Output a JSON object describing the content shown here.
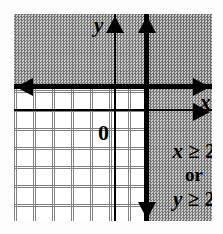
{
  "figure": {
    "type": "coordinate-plane-inequality-graph"
  },
  "axes": {
    "x_label": "x",
    "y_label": "y",
    "origin_label": "0",
    "x_axis_name": "x-axis",
    "y_axis_name": "y-axis",
    "grid_cell_size": 19,
    "grid_visible": true
  },
  "boundaries": [
    {
      "name": "horizontal-boundary",
      "equation": "y = 2",
      "style": "solid",
      "orientation": "horizontal",
      "arrows": [
        "left",
        "right"
      ]
    },
    {
      "name": "vertical-boundary",
      "equation": "x = 2",
      "style": "solid",
      "orientation": "vertical",
      "arrows": [
        "up",
        "down"
      ]
    }
  ],
  "shading": {
    "regions": [
      {
        "name": "region-y-ge-2",
        "condition": "y >= 2",
        "area": "above horizontal boundary"
      },
      {
        "name": "region-x-ge-2",
        "condition": "x >= 2",
        "area": "right of vertical boundary"
      }
    ],
    "fill": "#9a9a9a",
    "pattern": "halftone-dither"
  },
  "annotations": {
    "first_inequality": {
      "variable": "x",
      "relation": "≥",
      "value": "2",
      "full": "x ≥ 2"
    },
    "connector": "or",
    "second_inequality": {
      "variable": "y",
      "relation": "≥",
      "value": "2",
      "full": "y ≥ 2"
    }
  },
  "colors": {
    "ink": "#000000",
    "grid": "#6d6d6d",
    "shade": "#9a9a9a",
    "background": "#ffffff"
  }
}
